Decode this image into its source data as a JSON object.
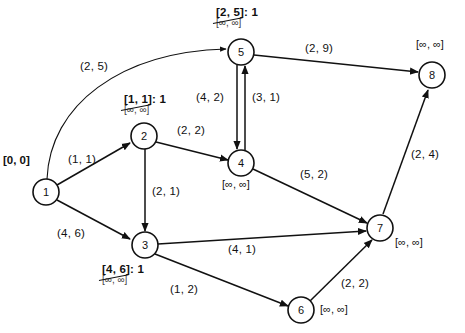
{
  "figure": {
    "type": "network-flow-diagram"
  },
  "nodes": [
    {
      "id": "1",
      "cx": 46,
      "cy": 192,
      "r": 13,
      "label_kind": "plain",
      "label": "[0, 0]",
      "label_x": 3,
      "label_y": 154
    },
    {
      "id": "2",
      "cx": 144,
      "cy": 136,
      "r": 13,
      "label_kind": "updated",
      "label_new": "[1, 1]: 1",
      "label_old": "[∞, ∞]",
      "label_x": 124,
      "label_y": 93
    },
    {
      "id": "3",
      "cx": 145,
      "cy": 245,
      "r": 13,
      "label_kind": "updated",
      "label_new": "[4, 6]: 1",
      "label_old": "[∞, ∞]",
      "label_x": 102,
      "label_y": 263
    },
    {
      "id": "4",
      "cx": 241,
      "cy": 163,
      "r": 13,
      "label_kind": "inf",
      "label": "[∞, ∞]",
      "label_x": 222,
      "label_y": 178
    },
    {
      "id": "5",
      "cx": 241,
      "cy": 52,
      "r": 13,
      "label_kind": "updated",
      "label_new": "[2, 5]: 1",
      "label_old": "[∞, ∞]",
      "label_x": 216,
      "label_y": 6
    },
    {
      "id": "6",
      "cx": 301,
      "cy": 310,
      "r": 13,
      "label_kind": "inf",
      "label": "[∞, ∞]",
      "label_x": 320,
      "label_y": 303
    },
    {
      "id": "7",
      "cx": 380,
      "cy": 228,
      "r": 13,
      "label_kind": "inf",
      "label": "[∞, ∞]",
      "label_x": 395,
      "label_y": 236
    },
    {
      "id": "8",
      "cx": 432,
      "cy": 75,
      "r": 13,
      "label_kind": "inf",
      "label": "[∞, ∞]",
      "label_x": 416,
      "label_y": 38
    }
  ],
  "edges": [
    {
      "from": "1",
      "to": "5",
      "label": "(2, 5)",
      "label_x": 80,
      "label_y": 60,
      "shape": "curve"
    },
    {
      "from": "1",
      "to": "2",
      "label": "(1, 1)",
      "label_x": 68,
      "label_y": 153,
      "shape": "line"
    },
    {
      "from": "1",
      "to": "3",
      "label": "(4, 6)",
      "label_x": 57,
      "label_y": 227,
      "shape": "line"
    },
    {
      "from": "2",
      "to": "4",
      "label": "(2, 2)",
      "label_x": 177,
      "label_y": 124,
      "shape": "line"
    },
    {
      "from": "2",
      "to": "3",
      "label": "(2, 1)",
      "label_x": 152,
      "label_y": 185,
      "shape": "line"
    },
    {
      "from": "5",
      "to": "4",
      "label": "(4, 2)",
      "label_x": 196,
      "label_y": 91,
      "shape": "line"
    },
    {
      "from": "4",
      "to": "5",
      "label": "(3, 1)",
      "label_x": 252,
      "label_y": 91,
      "shape": "line"
    },
    {
      "from": "5",
      "to": "8",
      "label": "(2, 9)",
      "label_x": 305,
      "label_y": 42,
      "shape": "line"
    },
    {
      "from": "4",
      "to": "7",
      "label": "(5, 2)",
      "label_x": 300,
      "label_y": 168,
      "shape": "line"
    },
    {
      "from": "3",
      "to": "7",
      "label": "(4, 1)",
      "label_x": 228,
      "label_y": 243,
      "shape": "line"
    },
    {
      "from": "3",
      "to": "6",
      "label": "(1, 2)",
      "label_x": 170,
      "label_y": 283,
      "shape": "line"
    },
    {
      "from": "6",
      "to": "7",
      "label": "(2, 2)",
      "label_x": 341,
      "label_y": 277,
      "shape": "line"
    },
    {
      "from": "7",
      "to": "8",
      "label": "(2, 4)",
      "label_x": 411,
      "label_y": 148,
      "shape": "line"
    }
  ],
  "colors": {
    "stroke": "#111111",
    "background": "#ffffff"
  }
}
